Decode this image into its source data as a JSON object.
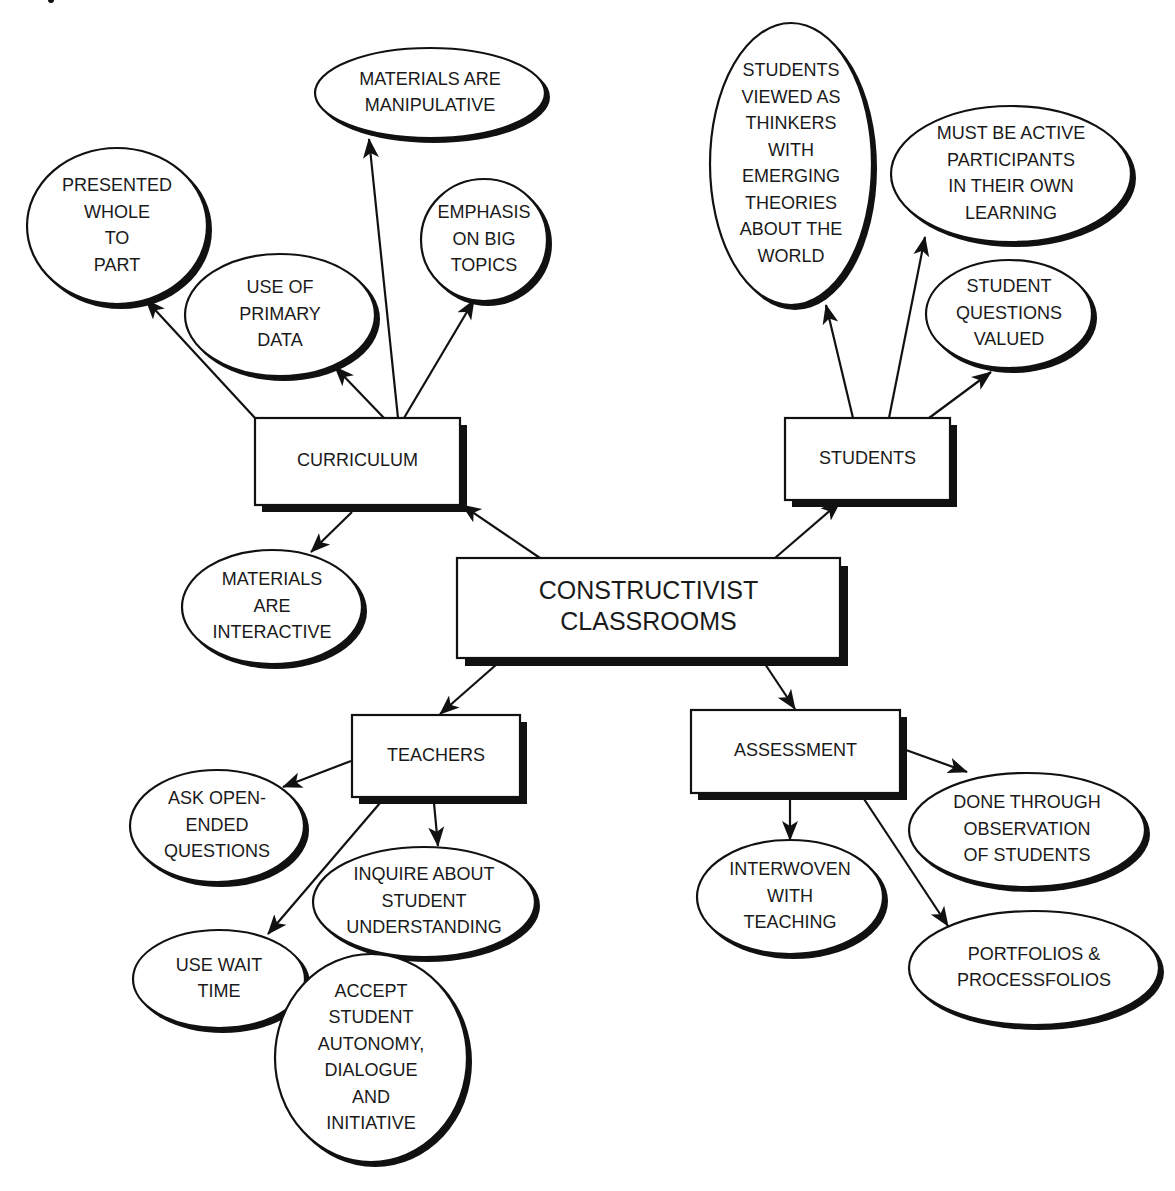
{
  "diagram": {
    "colors": {
      "ink": "#111111",
      "text": "#1a1a1a",
      "background": "#ffffff"
    },
    "boxes": [
      {
        "id": "center",
        "name": "constructivist-classrooms-box",
        "lines": [
          "CONSTRUCTIVIST",
          "CLASSROOMS"
        ],
        "x": 457,
        "y": 558,
        "w": 383,
        "h": 100,
        "shadow": 8,
        "fontSize": 25,
        "lineHeight": 31
      },
      {
        "id": "curriculum",
        "name": "curriculum-box",
        "lines": [
          "CURRICULUM"
        ],
        "x": 255,
        "y": 418,
        "w": 205,
        "h": 87,
        "shadow": 7,
        "fontSize": 18,
        "lineHeight": 22
      },
      {
        "id": "students",
        "name": "students-box",
        "lines": [
          "STUDENTS"
        ],
        "x": 785,
        "y": 418,
        "w": 165,
        "h": 82,
        "shadow": 7,
        "fontSize": 18,
        "lineHeight": 22
      },
      {
        "id": "teachers",
        "name": "teachers-box",
        "lines": [
          "TEACHERS"
        ],
        "x": 352,
        "y": 715,
        "w": 168,
        "h": 82,
        "shadow": 7,
        "fontSize": 18,
        "lineHeight": 22
      },
      {
        "id": "assessment",
        "name": "assessment-box",
        "lines": [
          "ASSESSMENT"
        ],
        "x": 691,
        "y": 710,
        "w": 209,
        "h": 83,
        "shadow": 7,
        "fontSize": 18,
        "lineHeight": 22
      }
    ],
    "ellipses": [
      {
        "id": "presented",
        "name": "presented-whole-to-part-node",
        "lines": [
          "PRESENTED",
          "WHOLE",
          "TO",
          "PART"
        ],
        "cx": 117,
        "cy": 226,
        "rx": 90,
        "ry": 78
      },
      {
        "id": "manipulative",
        "name": "materials-are-manipulative-node",
        "lines": [
          "MATERIALS ARE",
          "MANIPULATIVE"
        ],
        "cx": 430,
        "cy": 93,
        "rx": 115,
        "ry": 45
      },
      {
        "id": "primary",
        "name": "use-of-primary-data-node",
        "lines": [
          "USE OF",
          "PRIMARY",
          "DATA"
        ],
        "cx": 280,
        "cy": 315,
        "rx": 95,
        "ry": 61
      },
      {
        "id": "emphasis",
        "name": "emphasis-on-big-topics-node",
        "lines": [
          "EMPHASIS",
          "ON BIG",
          "TOPICS"
        ],
        "cx": 484,
        "cy": 240,
        "rx": 63,
        "ry": 61
      },
      {
        "id": "interactive",
        "name": "materials-are-interactive-node",
        "lines": [
          "MATERIALS",
          "ARE",
          "INTERACTIVE"
        ],
        "cx": 272,
        "cy": 607,
        "rx": 90,
        "ry": 57
      },
      {
        "id": "viewed",
        "name": "students-viewed-as-thinkers-node",
        "lines": [
          "STUDENTS",
          "VIEWED AS",
          "THINKERS",
          "WITH",
          "EMERGING",
          "THEORIES",
          "ABOUT THE",
          "WORLD"
        ],
        "cx": 791,
        "cy": 164,
        "rx": 81,
        "ry": 141
      },
      {
        "id": "active",
        "name": "must-be-active-participants-node",
        "lines": [
          "MUST BE ACTIVE",
          "PARTICIPANTS",
          "IN THEIR OWN",
          "LEARNING"
        ],
        "cx": 1011,
        "cy": 174,
        "rx": 120,
        "ry": 68
      },
      {
        "id": "questions",
        "name": "student-questions-valued-node",
        "lines": [
          "STUDENT",
          "QUESTIONS",
          "VALUED"
        ],
        "cx": 1009,
        "cy": 314,
        "rx": 83,
        "ry": 54
      },
      {
        "id": "openended",
        "name": "ask-open-ended-questions-node",
        "lines": [
          "ASK OPEN-",
          "ENDED",
          "QUESTIONS"
        ],
        "cx": 217,
        "cy": 826,
        "rx": 87,
        "ry": 56
      },
      {
        "id": "inquire",
        "name": "inquire-about-student-understanding-node",
        "lines": [
          "INQUIRE ABOUT",
          "STUDENT",
          "UNDERSTANDING"
        ],
        "cx": 424,
        "cy": 902,
        "rx": 111,
        "ry": 55
      },
      {
        "id": "waittime",
        "name": "use-wait-time-node",
        "lines": [
          "USE WAIT",
          "TIME"
        ],
        "cx": 219,
        "cy": 979,
        "rx": 86,
        "ry": 49
      },
      {
        "id": "autonomy",
        "name": "accept-student-autonomy-node",
        "lines": [
          "ACCEPT",
          "STUDENT",
          "AUTONOMY,",
          "DIALOGUE",
          "AND",
          "INITIATIVE"
        ],
        "cx": 371,
        "cy": 1058,
        "rx": 96,
        "ry": 104
      },
      {
        "id": "interwoven",
        "name": "interwoven-with-teaching-node",
        "lines": [
          "INTERWOVEN",
          "WITH",
          "TEACHING"
        ],
        "cx": 790,
        "cy": 897,
        "rx": 93,
        "ry": 57
      },
      {
        "id": "observation",
        "name": "done-through-observation-node",
        "lines": [
          "DONE THROUGH",
          "OBSERVATION",
          "OF STUDENTS"
        ],
        "cx": 1027,
        "cy": 830,
        "rx": 118,
        "ry": 57
      },
      {
        "id": "portfolios",
        "name": "portfolios-and-processfolios-node",
        "lines": [
          "PORTFOLIOS &",
          "PROCESSFOLIOS"
        ],
        "cx": 1034,
        "cy": 968,
        "rx": 125,
        "ry": 57
      }
    ],
    "ellipse_text": {
      "fontSize": 18,
      "lineHeight": 26.5
    },
    "edges": [
      {
        "from": "center",
        "to": "curriculum",
        "x1": 540,
        "y1": 558,
        "x2": 462,
        "y2": 505
      },
      {
        "from": "center",
        "to": "students",
        "x1": 775,
        "y1": 558,
        "x2": 840,
        "y2": 502
      },
      {
        "from": "center",
        "to": "teachers",
        "x1": 497,
        "y1": 664,
        "x2": 440,
        "y2": 714
      },
      {
        "from": "center",
        "to": "assessment",
        "x1": 765,
        "y1": 664,
        "x2": 795,
        "y2": 709
      },
      {
        "from": "curriculum",
        "to": "presented",
        "x1": 255,
        "y1": 418,
        "x2": 146,
        "y2": 300
      },
      {
        "from": "curriculum",
        "to": "primary",
        "x1": 384,
        "y1": 418,
        "x2": 335,
        "y2": 367
      },
      {
        "from": "curriculum",
        "to": "manipulative",
        "x1": 398,
        "y1": 418,
        "x2": 369,
        "y2": 139
      },
      {
        "from": "curriculum",
        "to": "emphasis",
        "x1": 404,
        "y1": 418,
        "x2": 474,
        "y2": 300
      },
      {
        "from": "curriculum",
        "to": "interactive",
        "x1": 352,
        "y1": 512,
        "x2": 311,
        "y2": 552
      },
      {
        "from": "students",
        "to": "viewed",
        "x1": 853,
        "y1": 418,
        "x2": 826,
        "y2": 305
      },
      {
        "from": "students",
        "to": "active",
        "x1": 889,
        "y1": 418,
        "x2": 925,
        "y2": 237
      },
      {
        "from": "students",
        "to": "questions",
        "x1": 929,
        "y1": 418,
        "x2": 991,
        "y2": 372
      },
      {
        "from": "teachers",
        "to": "openended",
        "x1": 351,
        "y1": 761,
        "x2": 283,
        "y2": 787
      },
      {
        "from": "teachers",
        "to": "inquire",
        "x1": 434,
        "y1": 803,
        "x2": 438,
        "y2": 846
      },
      {
        "from": "teachers",
        "to": "waittime",
        "x1": 380,
        "y1": 803,
        "x2": 268,
        "y2": 934
      },
      {
        "from": "assessment",
        "to": "interwoven",
        "x1": 790,
        "y1": 799,
        "x2": 790,
        "y2": 840
      },
      {
        "from": "assessment",
        "to": "observation",
        "x1": 906,
        "y1": 750,
        "x2": 967,
        "y2": 772
      },
      {
        "from": "assessment",
        "to": "portfolios",
        "x1": 864,
        "y1": 799,
        "x2": 948,
        "y2": 926
      }
    ],
    "speck": {
      "cx": 51,
      "cy": 0,
      "r": 3
    }
  }
}
